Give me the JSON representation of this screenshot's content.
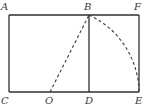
{
  "diagram": {
    "type": "geometry-figure",
    "points": {
      "A": {
        "label": "A",
        "x": 9,
        "y": 15
      },
      "B": {
        "label": "B",
        "x": 89,
        "y": 15
      },
      "F": {
        "label": "F",
        "x": 139,
        "y": 15
      },
      "C": {
        "label": "C",
        "x": 9,
        "y": 92
      },
      "O": {
        "label": "O",
        "x": 50,
        "y": 92
      },
      "D": {
        "label": "D",
        "x": 89,
        "y": 92
      },
      "E": {
        "label": "E",
        "x": 139,
        "y": 92
      }
    },
    "segments": [
      {
        "from": "A",
        "to": "F",
        "style": "solid"
      },
      {
        "from": "F",
        "to": "E",
        "style": "solid"
      },
      {
        "from": "C",
        "to": "E",
        "style": "solid"
      },
      {
        "from": "A",
        "to": "C",
        "style": "solid"
      },
      {
        "from": "B",
        "to": "D",
        "style": "solid"
      },
      {
        "from": "O",
        "to": "B",
        "style": "dashed"
      }
    ],
    "arcs": [
      {
        "from": "B",
        "to": "E",
        "style": "dashed"
      }
    ],
    "colors": {
      "line": "#2f2f2f",
      "label": "#3a3a3a",
      "background": "#ffffff"
    }
  }
}
